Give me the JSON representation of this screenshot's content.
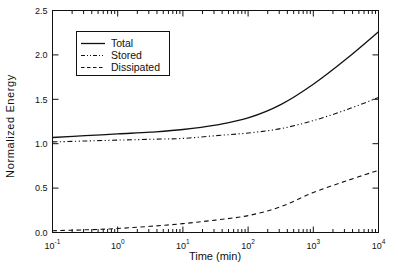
{
  "figure": {
    "background": "#ffffff",
    "ink_color": "#111111"
  },
  "chart_data": {
    "type": "line",
    "title": "",
    "xlabel": "Time (min)",
    "ylabel": "Normalized Energy",
    "x_scale": "log10",
    "x_tick_base": "10",
    "x_range_exponents": [
      -1,
      4
    ],
    "x_tick_exponents": [
      -1,
      0,
      1,
      2,
      3,
      4
    ],
    "x_minor_ticks": true,
    "ylim": [
      0,
      2.5
    ],
    "y_ticks": [
      0.0,
      0.5,
      1.0,
      1.5,
      2.0,
      2.5
    ],
    "y_tick_labels": [
      "0.0",
      "0.5",
      "1.0",
      "1.5",
      "2.0",
      "2.5"
    ],
    "grid": false,
    "frame": "box-with-inward-ticks",
    "legend_position": "upper-left",
    "series": [
      {
        "name": "Total",
        "style": "solid",
        "color": "#111111",
        "log10_x": [
          -1,
          -0.5,
          0,
          0.5,
          1,
          1.5,
          2,
          2.5,
          3,
          3.5,
          4
        ],
        "values": [
          1.07,
          1.09,
          1.11,
          1.13,
          1.16,
          1.21,
          1.29,
          1.44,
          1.67,
          1.95,
          2.26
        ]
      },
      {
        "name": "Stored",
        "style": "dash-dot-dot",
        "color": "#111111",
        "log10_x": [
          -1,
          -0.5,
          0,
          0.5,
          1,
          1.5,
          2,
          2.5,
          3,
          3.5,
          4
        ],
        "values": [
          1.02,
          1.03,
          1.04,
          1.05,
          1.06,
          1.09,
          1.12,
          1.17,
          1.26,
          1.38,
          1.52
        ]
      },
      {
        "name": "Dissipated",
        "style": "dashed",
        "color": "#111111",
        "log10_x": [
          -1,
          -0.5,
          0,
          0.5,
          1,
          1.5,
          2,
          2.5,
          3,
          3.5,
          4
        ],
        "values": [
          0.02,
          0.03,
          0.045,
          0.07,
          0.1,
          0.14,
          0.19,
          0.29,
          0.45,
          0.58,
          0.7
        ]
      }
    ]
  }
}
